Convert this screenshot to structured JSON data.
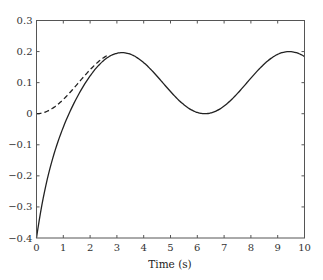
{
  "chart_data": {
    "type": "line",
    "title": "",
    "xlabel": "Time (s)",
    "ylabel": "",
    "xlim": [
      0,
      10
    ],
    "ylim": [
      -0.4,
      0.3
    ],
    "xticks": [
      0,
      1,
      2,
      3,
      4,
      5,
      6,
      7,
      8,
      9,
      10
    ],
    "yticks": [
      -0.4,
      -0.3,
      -0.2,
      -0.1,
      0,
      0.1,
      0.2,
      0.3
    ],
    "xtick_labels": [
      "0",
      "1",
      "2",
      "3",
      "4",
      "5",
      "6",
      "7",
      "8",
      "9",
      "10"
    ],
    "ytick_labels": [
      "-0.4",
      "-0.3",
      "-0.2",
      "-0.1",
      "0",
      "0.1",
      "0.2",
      "0.3"
    ],
    "grid": false,
    "legend": null,
    "x": [
      0,
      0.25,
      0.5,
      0.75,
      1,
      1.25,
      1.5,
      1.75,
      2,
      2.25,
      2.5,
      2.75,
      3,
      3.25,
      3.5,
      3.75,
      4,
      4.25,
      4.5,
      4.75,
      5,
      5.25,
      5.5,
      5.75,
      6,
      6.25,
      6.5,
      6.75,
      7,
      7.25,
      7.5,
      7.75,
      8,
      8.25,
      8.5,
      8.75,
      9,
      9.25,
      9.5,
      9.75,
      10
    ],
    "series": [
      {
        "name": "response",
        "style": "solid",
        "color": "#222222",
        "values": [
          -0.4,
          -0.272,
          -0.181,
          -0.102,
          -0.043,
          0.001,
          0.037,
          0.064,
          0.092,
          0.115,
          0.171,
          0.189,
          0.194,
          0.199,
          0.194,
          0.182,
          0.165,
          0.145,
          0.121,
          0.096,
          0.072,
          0.049,
          0.029,
          0.014,
          0.004,
          0.0,
          0.002,
          0.01,
          0.025,
          0.043,
          0.065,
          0.089,
          0.115,
          0.139,
          0.16,
          0.178,
          0.191,
          0.199,
          0.2,
          0.195,
          0.184
        ]
      },
      {
        "name": "steady-state",
        "style": "dashed",
        "color": "#222222",
        "values": [
          0.0,
          0.003,
          0.012,
          0.027,
          0.046,
          0.068,
          0.093,
          0.118,
          0.142,
          0.163,
          0.18,
          0.192,
          0.199,
          0.199,
          0.194,
          0.182,
          0.165,
          0.145,
          0.121,
          0.096,
          0.072,
          0.049,
          0.029,
          0.014,
          0.004,
          0.0,
          0.002,
          0.01,
          0.025,
          0.043,
          0.065,
          0.089,
          0.115,
          0.139,
          0.16,
          0.178,
          0.191,
          0.199,
          0.2,
          0.195,
          0.184
        ]
      }
    ]
  }
}
